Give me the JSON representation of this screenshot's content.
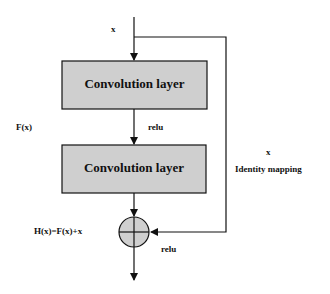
{
  "diagram": {
    "type": "residual-block",
    "colors": {
      "box_fill": "#cfcfcf",
      "line": "#111111",
      "background": "#ffffff"
    },
    "input_label": "x",
    "blocks": [
      {
        "label": "Convolution layer"
      },
      {
        "label": "Convolution layer"
      }
    ],
    "activation_between": "relu",
    "residual_function_label": "F(x)",
    "shortcut": {
      "label_top": "x",
      "label_bottom": "Identity mapping"
    },
    "sum_label": "H(x)=F(x)+x",
    "activation_after_sum": "relu"
  }
}
